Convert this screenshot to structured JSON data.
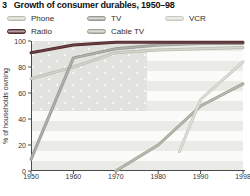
{
  "header": {
    "figure_number": "3",
    "title": "Growth of consumer durables, 1950–98"
  },
  "chart_data": {
    "type": "line",
    "title": "Growth of consumer durables, 1950–98",
    "xlabel": "",
    "ylabel": "% of households owning",
    "ylim": [
      0,
      100
    ],
    "x_ticks": [
      1950,
      1960,
      1970,
      1980,
      1990,
      1998
    ],
    "y_ticks": [
      100,
      80,
      60,
      40,
      20,
      0
    ],
    "grid": false,
    "legend_position": "top",
    "background": "faded US flag (stars canton top-left, horizontal stripes)",
    "axis_color": "#4a4a4a",
    "series": [
      {
        "name": "Phone",
        "color": "#d3d6cb",
        "edge_color": "#b9bdb0",
        "points": [
          {
            "year": 1950,
            "pct": 71
          },
          {
            "year": 1960,
            "pct": 80
          },
          {
            "year": 1970,
            "pct": 91
          },
          {
            "year": 1980,
            "pct": 93
          },
          {
            "year": 1990,
            "pct": 94
          },
          {
            "year": 1998,
            "pct": 95
          }
        ]
      },
      {
        "name": "TV",
        "color": "#aeb1a9",
        "edge_color": "#969a92",
        "points": [
          {
            "year": 1950,
            "pct": 9
          },
          {
            "year": 1960,
            "pct": 87
          },
          {
            "year": 1970,
            "pct": 94
          },
          {
            "year": 1980,
            "pct": 97
          },
          {
            "year": 1990,
            "pct": 98
          },
          {
            "year": 1998,
            "pct": 98
          }
        ]
      },
      {
        "name": "VCR",
        "color": "#dde0d7",
        "edge_color": "#c6c9bf",
        "points": [
          {
            "year": 1985,
            "pct": 15
          },
          {
            "year": 1990,
            "pct": 55
          },
          {
            "year": 1998,
            "pct": 84
          }
        ]
      },
      {
        "name": "Radio",
        "color": "#6d3b3f",
        "edge_color": "#4e2d30",
        "points": [
          {
            "year": 1950,
            "pct": 91
          },
          {
            "year": 1960,
            "pct": 97
          },
          {
            "year": 1970,
            "pct": 99
          },
          {
            "year": 1980,
            "pct": 99
          },
          {
            "year": 1990,
            "pct": 99
          },
          {
            "year": 1998,
            "pct": 99
          }
        ]
      },
      {
        "name": "Cable TV",
        "color": "#b6bbad",
        "edge_color": "#9aa092",
        "points": [
          {
            "year": 1970,
            "pct": 0
          },
          {
            "year": 1980,
            "pct": 20
          },
          {
            "year": 1990,
            "pct": 50
          },
          {
            "year": 1998,
            "pct": 67
          }
        ]
      }
    ]
  }
}
